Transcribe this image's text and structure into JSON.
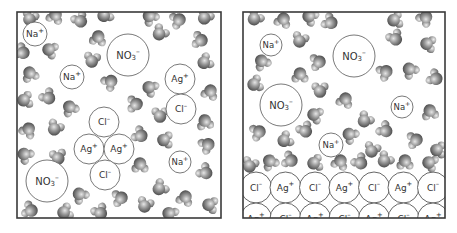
{
  "figure": {
    "colors": {
      "background": "#ffffff",
      "border": "#3a3a3a",
      "ion_stroke": "#6a6a6a",
      "ion_text": "#333333",
      "water_light": "#e6e6e6",
      "water_mid": "#9a9a9a",
      "water_dark": "#4a4a4a"
    }
  },
  "panels": [
    {
      "name": "solution-panel",
      "box": {
        "x": 17,
        "y": 12,
        "w": 204,
        "h": 206
      },
      "ions": [
        {
          "label": "Na",
          "sup": "+",
          "x": 35,
          "y": 34,
          "r": 12,
          "fs": 9
        },
        {
          "label": "NO",
          "sub": "3",
          "sup": "–",
          "x": 128,
          "y": 55,
          "r": 21,
          "fs": 10
        },
        {
          "label": "Na",
          "sup": "+",
          "x": 72,
          "y": 77,
          "r": 12,
          "fs": 9
        },
        {
          "label": "Ag",
          "sup": "+",
          "x": 180,
          "y": 79,
          "r": 15,
          "fs": 9
        },
        {
          "label": "Cl",
          "sup": "–",
          "x": 181,
          "y": 109,
          "r": 15,
          "fs": 9
        },
        {
          "label": "Cl",
          "sup": "–",
          "x": 104,
          "y": 122,
          "r": 15,
          "fs": 9
        },
        {
          "label": "Ag",
          "sup": "+",
          "x": 89,
          "y": 149,
          "r": 15,
          "fs": 9
        },
        {
          "label": "Ag",
          "sup": "+",
          "x": 119,
          "y": 149,
          "r": 15,
          "fs": 9
        },
        {
          "label": "Cl",
          "sup": "–",
          "x": 105,
          "y": 175,
          "r": 15,
          "fs": 9
        },
        {
          "label": "Na",
          "sup": "+",
          "x": 180,
          "y": 162,
          "r": 11,
          "fs": 8.5
        },
        {
          "label": "NO",
          "sub": "3",
          "sup": "–",
          "x": 47,
          "y": 181,
          "r": 21,
          "fs": 10
        }
      ],
      "water": [
        [
          30,
          18,
          20
        ],
        [
          55,
          16,
          200
        ],
        [
          80,
          20,
          330
        ],
        [
          105,
          15,
          60
        ],
        [
          150,
          17,
          140
        ],
        [
          178,
          20,
          250
        ],
        [
          205,
          17,
          30
        ],
        [
          22,
          52,
          300
        ],
        [
          50,
          50,
          110
        ],
        [
          98,
          38,
          190
        ],
        [
          160,
          33,
          40
        ],
        [
          200,
          40,
          280
        ],
        [
          30,
          74,
          160
        ],
        [
          92,
          60,
          10
        ],
        [
          110,
          82,
          230
        ],
        [
          150,
          88,
          120
        ],
        [
          205,
          62,
          60
        ],
        [
          210,
          92,
          200
        ],
        [
          25,
          100,
          80
        ],
        [
          48,
          97,
          320
        ],
        [
          70,
          108,
          150
        ],
        [
          135,
          104,
          270
        ],
        [
          160,
          115,
          0
        ],
        [
          205,
          122,
          170
        ],
        [
          28,
          130,
          210
        ],
        [
          55,
          128,
          30
        ],
        [
          140,
          135,
          300
        ],
        [
          165,
          140,
          90
        ],
        [
          207,
          145,
          240
        ],
        [
          25,
          155,
          130
        ],
        [
          58,
          157,
          350
        ],
        [
          140,
          165,
          180
        ],
        [
          160,
          188,
          50
        ],
        [
          205,
          172,
          310
        ],
        [
          80,
          195,
          140
        ],
        [
          120,
          198,
          260
        ],
        [
          145,
          205,
          20
        ],
        [
          185,
          198,
          200
        ],
        [
          210,
          205,
          100
        ],
        [
          30,
          210,
          290
        ],
        [
          65,
          212,
          70
        ],
        [
          100,
          212,
          330
        ],
        [
          170,
          214,
          120
        ]
      ]
    },
    {
      "name": "precipitate-panel",
      "box": {
        "x": 243,
        "y": 12,
        "w": 202,
        "h": 206
      },
      "ions": [
        {
          "label": "Na",
          "sup": "+",
          "x": 271,
          "y": 45,
          "r": 11,
          "fs": 8.5
        },
        {
          "label": "NO",
          "sub": "3",
          "sup": "–",
          "x": 354,
          "y": 56,
          "r": 21,
          "fs": 10
        },
        {
          "label": "NO",
          "sub": "3",
          "sup": "–",
          "x": 281,
          "y": 105,
          "r": 21,
          "fs": 10
        },
        {
          "label": "Na",
          "sup": "+",
          "x": 402,
          "y": 107,
          "r": 11,
          "fs": 8.5
        },
        {
          "label": "Na",
          "sup": "+",
          "x": 331,
          "y": 145,
          "r": 12,
          "fs": 8.5
        }
      ],
      "water": [
        [
          255,
          18,
          40
        ],
        [
          283,
          20,
          200
        ],
        [
          310,
          17,
          120
        ],
        [
          330,
          22,
          300
        ],
        [
          395,
          20,
          80
        ],
        [
          425,
          18,
          220
        ],
        [
          262,
          62,
          150
        ],
        [
          300,
          40,
          20
        ],
        [
          318,
          62,
          260
        ],
        [
          395,
          38,
          330
        ],
        [
          428,
          44,
          100
        ],
        [
          255,
          84,
          70
        ],
        [
          300,
          75,
          180
        ],
        [
          320,
          90,
          0
        ],
        [
          385,
          72,
          240
        ],
        [
          410,
          70,
          140
        ],
        [
          435,
          78,
          300
        ],
        [
          315,
          115,
          110
        ],
        [
          345,
          100,
          200
        ],
        [
          365,
          120,
          40
        ],
        [
          385,
          130,
          310
        ],
        [
          430,
          112,
          170
        ],
        [
          258,
          132,
          250
        ],
        [
          285,
          140,
          60
        ],
        [
          305,
          130,
          330
        ],
        [
          350,
          135,
          130
        ],
        [
          372,
          150,
          20
        ],
        [
          415,
          140,
          260
        ],
        [
          438,
          150,
          90
        ],
        [
          250,
          165,
          20
        ],
        [
          270,
          162,
          150
        ],
        [
          290,
          160,
          290
        ],
        [
          315,
          163,
          80
        ],
        [
          340,
          162,
          200
        ],
        [
          360,
          162,
          320
        ],
        [
          385,
          160,
          40
        ],
        [
          405,
          162,
          180
        ],
        [
          430,
          163,
          110
        ]
      ],
      "lattice": {
        "top": 172,
        "row_spacing": 31,
        "col_spacing": 29.5,
        "start_x": 256,
        "radius": 15.5,
        "rows": [
          [
            "Cl",
            "Ag",
            "Cl",
            "Ag",
            "Cl",
            "Ag",
            "Cl"
          ],
          [
            "Ag",
            "Cl",
            "Ag",
            "Cl",
            "Ag",
            "Cl",
            "Ag"
          ]
        ],
        "charges": {
          "Cl": "–",
          "Ag": "+"
        }
      }
    }
  ]
}
